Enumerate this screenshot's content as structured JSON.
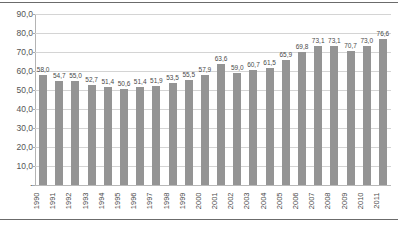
{
  "chart_data": {
    "type": "bar",
    "title": "",
    "subtitle": "",
    "xlabel": "",
    "ylabel": "",
    "categories": [
      "1990",
      "1991",
      "1992",
      "1993",
      "1994",
      "1995",
      "1996",
      "1997",
      "1998",
      "1999",
      "2000",
      "2001",
      "2002",
      "2003",
      "2004",
      "2005",
      "2006",
      "2007",
      "2008",
      "2009",
      "2010",
      "2011"
    ],
    "values": [
      58.0,
      54.7,
      55.0,
      52.7,
      51.4,
      50.6,
      51.4,
      51.9,
      53.5,
      55.5,
      57.9,
      63.6,
      59.0,
      60.7,
      61.5,
      65.9,
      69.8,
      73.1,
      73.1,
      70.7,
      73.0,
      76.6
    ],
    "value_labels": [
      "58,0",
      "54,7",
      "55,0",
      "52,7",
      "51,4",
      "50,6",
      "51,4",
      "51,9",
      "53,5",
      "55,5",
      "57,9",
      "63,6",
      "59,0",
      "60,7",
      "61,5",
      "65,9",
      "69,8",
      "73,1",
      "73,1",
      "70,7",
      "73,0",
      "76,6"
    ],
    "ylim": [
      0,
      90
    ],
    "ytick_values": [
      0,
      10,
      20,
      30,
      40,
      50,
      60,
      70,
      80,
      90
    ],
    "ytick_labels": [
      "-",
      "10,0",
      "20,0",
      "30,0",
      "40,0",
      "50,0",
      "60,0",
      "70,0",
      "80,0",
      "90,0"
    ],
    "grid": true,
    "legend": null,
    "legend_position": "none",
    "series": [
      {
        "name": "",
        "values": [
          58.0,
          54.7,
          55.0,
          52.7,
          51.4,
          50.6,
          51.4,
          51.9,
          53.5,
          55.5,
          57.9,
          63.6,
          59.0,
          60.7,
          61.5,
          65.9,
          69.8,
          73.1,
          73.1,
          70.7,
          73.0,
          76.6
        ]
      }
    ]
  },
  "style": {
    "bar_color": "#949494",
    "gridline_color": "#d4d4d4",
    "axis_color": "#b4b4b4",
    "frame_color": "#6b6b6b",
    "label_color": "#4a4a4a",
    "background": "#ffffff"
  }
}
